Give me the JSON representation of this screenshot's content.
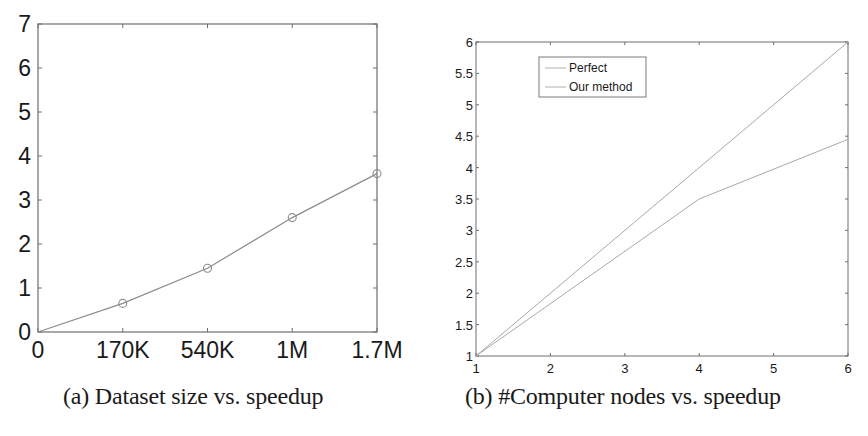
{
  "chart_data": [
    {
      "id": "a",
      "type": "line",
      "title": "",
      "caption": "(a) Dataset size vs. speedup",
      "xlabel": "",
      "ylabel": "",
      "categories": [
        "0",
        "170K",
        "540K",
        "1M",
        "1.7M"
      ],
      "x_tick_labels": [
        "0",
        "170K",
        "540K",
        "1M",
        "1.7M"
      ],
      "y_ticks": [
        0,
        1,
        2,
        3,
        4,
        5,
        6,
        7
      ],
      "ylim": [
        0,
        7
      ],
      "grid": false,
      "legend": null,
      "series": [
        {
          "name": "speedup",
          "marker": "circle",
          "values": [
            0,
            0.65,
            1.45,
            2.6,
            3.6
          ],
          "marked_points": [
            false,
            true,
            true,
            true,
            true
          ]
        }
      ]
    },
    {
      "id": "b",
      "type": "line",
      "title": "",
      "caption": "(b) #Computer nodes vs. speedup",
      "xlabel": "",
      "ylabel": "",
      "x": [
        1,
        2,
        3,
        4,
        5,
        6
      ],
      "x_ticks": [
        1,
        2,
        3,
        4,
        5,
        6
      ],
      "xlim": [
        1,
        6
      ],
      "y_ticks": [
        1,
        1.5,
        2,
        2.5,
        3,
        3.5,
        4,
        4.5,
        5,
        5.5,
        6
      ],
      "y_tick_labels": [
        "1",
        "1.5",
        "2",
        "2.5",
        "3",
        "3.5",
        "4",
        "4.5",
        "5",
        "5.5",
        "6"
      ],
      "ylim": [
        1,
        6
      ],
      "grid": false,
      "legend": {
        "position": "upper-left-inside",
        "entries": [
          "Perfect",
          "Our method"
        ]
      },
      "series": [
        {
          "name": "Perfect",
          "points": [
            [
              1,
              1
            ],
            [
              6,
              6
            ]
          ]
        },
        {
          "name": "Our method",
          "points": [
            [
              1,
              1
            ],
            [
              4,
              3.5
            ],
            [
              6,
              4.45
            ]
          ]
        }
      ]
    }
  ],
  "captions": {
    "a": "(a) Dataset size vs. speedup",
    "b": "(b) #Computer nodes vs. speedup"
  },
  "colors": {
    "axis": "#6e6e6e",
    "line": "#8c8c8c",
    "legend_border": "#7a7a7a",
    "text": "#1a1a1a"
  }
}
